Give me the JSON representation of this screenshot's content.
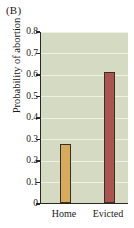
{
  "figure": {
    "panel_label": "(B)",
    "background_color": "#ffffff",
    "plot_background_color": "#d5dac2",
    "gridline_color": "#f2f3ea",
    "axis_color": "#2a2a24"
  },
  "chart_data": {
    "type": "bar",
    "title": "(B)",
    "xlabel": "",
    "ylabel": "Probability of abortion",
    "categories": [
      "Home",
      "Evicted"
    ],
    "values": [
      0.275,
      0.61
    ],
    "series": [
      {
        "name": "Probability of abortion",
        "values": [
          0.275,
          0.61
        ]
      }
    ],
    "bar_colors": [
      "#d6ab5e",
      "#a8564f"
    ],
    "bar_edge_color": "#3b2f22",
    "ylim": [
      0,
      0.8
    ],
    "ytick_values": [
      0,
      0.1,
      0.2,
      0.3,
      0.4,
      0.5,
      0.6,
      0.7,
      0.8
    ],
    "ytick_labels": [
      "0",
      "0.1",
      "0.2",
      "0.3",
      "0.4",
      "0.5",
      "0.6",
      "0.7",
      "0.8"
    ],
    "grid": true,
    "grid_axis": "y",
    "legend": false,
    "legend_position": "none"
  }
}
